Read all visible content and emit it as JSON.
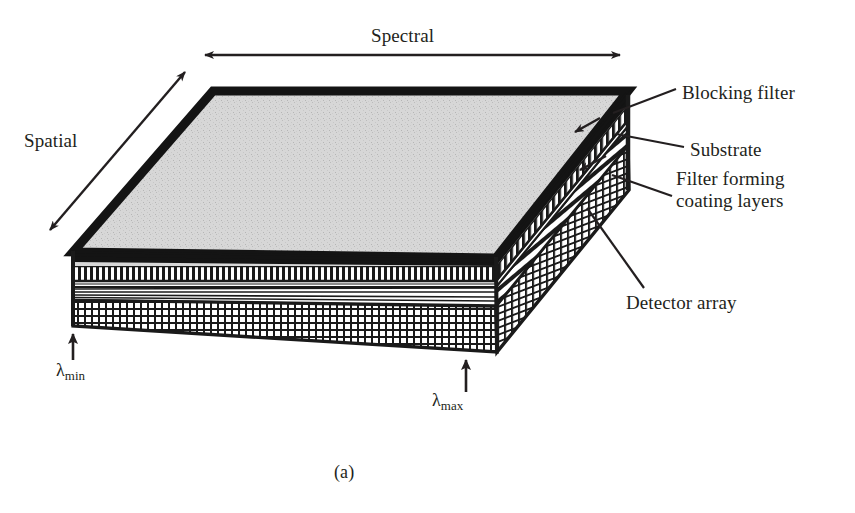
{
  "figure": {
    "caption": "(a)",
    "background_color": "#ffffff",
    "ink_color": "#231f20",
    "top_face_fill": "#d9d9d9"
  },
  "axes": [
    {
      "id": "spectral",
      "label": "Spectral",
      "arrow": "double-headed",
      "orientation": "horizontal",
      "position": "top"
    },
    {
      "id": "spatial",
      "label": "Spatial",
      "arrow": "double-headed",
      "orientation": "diagonal",
      "position": "left"
    }
  ],
  "callouts": [
    {
      "id": "blocking-filter",
      "label": "Blocking filter",
      "lines": [
        "Blocking filter"
      ],
      "leader": "to top layer of right face"
    },
    {
      "id": "substrate",
      "label": "Substrate",
      "lines": [
        "Substrate"
      ],
      "leader": "to middle band of right face"
    },
    {
      "id": "filter-coating",
      "label": "Filter forming coating layers",
      "lines": [
        "Filter forming",
        "coating layers"
      ],
      "leader": "to wedge coating band of right face"
    },
    {
      "id": "detector-array",
      "label": "Detector array",
      "lines": [
        "Detector array"
      ],
      "leader": "to cross-hatched bottom slab"
    }
  ],
  "wavelength_markers": [
    {
      "id": "lambda-min",
      "symbol": "λ",
      "subscript": "min",
      "arrow": "up",
      "position": "front-left corner"
    },
    {
      "id": "lambda-max",
      "symbol": "λ",
      "subscript": "max",
      "arrow": "up",
      "position": "front-right corner"
    }
  ],
  "layers": [
    {
      "id": "blocking-filter-layer",
      "pattern": "vertical-stripes",
      "order": 1
    },
    {
      "id": "substrate-layer",
      "pattern": "thin-horizontal-lines",
      "order": 2
    },
    {
      "id": "coating-layers",
      "pattern": "wedge-diagonal-lines",
      "order": 3
    },
    {
      "id": "detector-array-layer",
      "pattern": "cross-hatch-grid",
      "order": 4
    }
  ]
}
